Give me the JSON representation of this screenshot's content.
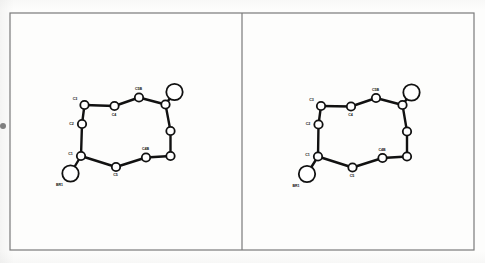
{
  "figure": {
    "kind": "molecular-structure-stereo-pair",
    "frame": {
      "x": 10,
      "y": 13,
      "width": 464,
      "height": 237,
      "stroke": "#7a7a7a",
      "stroke_width": 1.2
    },
    "divider_x": 242,
    "background": "#fdfdfc",
    "ink_color": "#111111",
    "atom_fill": "#ffffff",
    "bond_width": 2.4,
    "label_size": 3.6,
    "edge_mark": {
      "x": 0,
      "y": 123,
      "size": 6,
      "color": "#6a6a6a"
    }
  },
  "panels": [
    {
      "name": "left-view",
      "atoms": [
        {
          "id": "a_c3",
          "label": "C3",
          "x": 84.5,
          "y": 105.0,
          "r": 4.2,
          "label_dx": -9.5,
          "label_dy": -5.5
        },
        {
          "id": "a_c2",
          "label": "C2",
          "x": 82.0,
          "y": 124.0,
          "r": 4.2,
          "label_dx": -10.5,
          "label_dy": 0.5
        },
        {
          "id": "a_c1",
          "label": "C1",
          "x": 81.0,
          "y": 156.0,
          "r": 4.2,
          "label_dx": -10.5,
          "label_dy": -1.0
        },
        {
          "id": "a_br1",
          "label": "BR1",
          "x": 70.5,
          "y": 173.5,
          "r": 8.2,
          "label_dx": -11.0,
          "label_dy": 12.5
        },
        {
          "id": "a_c5",
          "label": "C5",
          "x": 116.0,
          "y": 167.0,
          "r": 4.2,
          "label_dx": -0.5,
          "label_dy": 9.0
        },
        {
          "id": "a_c4b",
          "label": "C4B",
          "x": 146.0,
          "y": 157.5,
          "r": 4.2,
          "label_dx": -0.5,
          "label_dy": -7.5
        },
        {
          "id": "a_r1",
          "label": "",
          "x": 170.5,
          "y": 156.0,
          "r": 4.2,
          "label_dx": 0,
          "label_dy": 0
        },
        {
          "id": "a_r2",
          "label": "",
          "x": 170.5,
          "y": 131.0,
          "r": 4.2,
          "label_dx": 0,
          "label_dy": 0
        },
        {
          "id": "a_r3",
          "label": "",
          "x": 165.5,
          "y": 104.5,
          "r": 4.2,
          "label_dx": 0,
          "label_dy": 0
        },
        {
          "id": "a_br2",
          "label": "",
          "x": 174.5,
          "y": 92.0,
          "r": 8.2,
          "label_dx": 0,
          "label_dy": 0
        },
        {
          "id": "a_c5b",
          "label": "C5B",
          "x": 139.0,
          "y": 97.5,
          "r": 4.2,
          "label_dx": -0.5,
          "label_dy": -7.5
        },
        {
          "id": "a_c4",
          "label": "C4",
          "x": 114.5,
          "y": 106.0,
          "r": 4.2,
          "label_dx": -0.5,
          "label_dy": 9.5
        }
      ],
      "bonds": [
        [
          "a_c3",
          "a_c4"
        ],
        [
          "a_c4",
          "a_c5b"
        ],
        [
          "a_c5b",
          "a_r3"
        ],
        [
          "a_r3",
          "a_br2"
        ],
        [
          "a_r3",
          "a_r2"
        ],
        [
          "a_r2",
          "a_r1"
        ],
        [
          "a_r1",
          "a_c4b"
        ],
        [
          "a_c4b",
          "a_c5"
        ],
        [
          "a_c5",
          "a_c1"
        ],
        [
          "a_c1",
          "a_br1"
        ],
        [
          "a_c1",
          "a_c2"
        ],
        [
          "a_c2",
          "a_c3"
        ]
      ]
    },
    {
      "name": "right-view",
      "atoms": [
        {
          "id": "b_c3",
          "label": "C3",
          "x": 321.0,
          "y": 106.0,
          "r": 4.2,
          "label_dx": -9.5,
          "label_dy": -5.5
        },
        {
          "id": "b_c2",
          "label": "C2",
          "x": 318.5,
          "y": 124.5,
          "r": 4.2,
          "label_dx": -10.5,
          "label_dy": 0.5
        },
        {
          "id": "b_c1",
          "label": "C1",
          "x": 318.0,
          "y": 156.5,
          "r": 4.2,
          "label_dx": -10.5,
          "label_dy": -1.0
        },
        {
          "id": "b_br1",
          "label": "BR1",
          "x": 307.0,
          "y": 174.0,
          "r": 8.2,
          "label_dx": -11.0,
          "label_dy": 12.5
        },
        {
          "id": "b_c5",
          "label": "C5",
          "x": 352.5,
          "y": 167.5,
          "r": 4.2,
          "label_dx": -0.5,
          "label_dy": 9.0
        },
        {
          "id": "b_c4b",
          "label": "C4B",
          "x": 382.5,
          "y": 158.0,
          "r": 4.2,
          "label_dx": -0.5,
          "label_dy": -7.5
        },
        {
          "id": "b_r1",
          "label": "",
          "x": 407.0,
          "y": 156.5,
          "r": 4.2,
          "label_dx": 0,
          "label_dy": 0
        },
        {
          "id": "b_r2",
          "label": "",
          "x": 407.0,
          "y": 131.5,
          "r": 4.2,
          "label_dx": 0,
          "label_dy": 0
        },
        {
          "id": "b_r3",
          "label": "",
          "x": 402.5,
          "y": 105.0,
          "r": 4.2,
          "label_dx": 0,
          "label_dy": 0
        },
        {
          "id": "b_br2",
          "label": "",
          "x": 411.5,
          "y": 92.5,
          "r": 8.2,
          "label_dx": 0,
          "label_dy": 0
        },
        {
          "id": "b_c5b",
          "label": "C5B",
          "x": 376.0,
          "y": 98.0,
          "r": 4.2,
          "label_dx": -0.5,
          "label_dy": -7.5
        },
        {
          "id": "b_c4",
          "label": "C4",
          "x": 351.0,
          "y": 106.5,
          "r": 4.2,
          "label_dx": -0.5,
          "label_dy": 9.5
        }
      ],
      "bonds": [
        [
          "b_c3",
          "b_c4"
        ],
        [
          "b_c4",
          "b_c5b"
        ],
        [
          "b_c5b",
          "b_r3"
        ],
        [
          "b_r3",
          "b_br2"
        ],
        [
          "b_r3",
          "b_r2"
        ],
        [
          "b_r2",
          "b_r1"
        ],
        [
          "b_r1",
          "b_c4b"
        ],
        [
          "b_c4b",
          "b_c5"
        ],
        [
          "b_c5",
          "b_c1"
        ],
        [
          "b_c1",
          "b_br1"
        ],
        [
          "b_c1",
          "b_c2"
        ],
        [
          "b_c2",
          "b_c3"
        ]
      ]
    }
  ]
}
